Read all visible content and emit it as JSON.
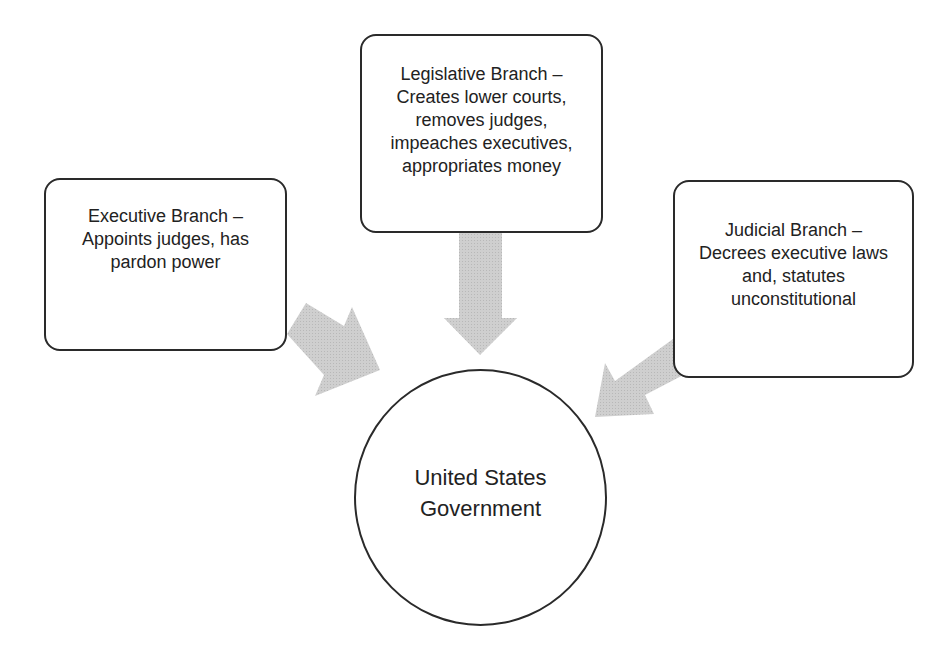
{
  "diagram": {
    "center": {
      "label": "United States Government"
    },
    "branches": [
      {
        "id": "executive",
        "label": "Executive Branch – Appoints judges, has pardon power"
      },
      {
        "id": "legislative",
        "label": "Legislative Branch – Creates lower courts, removes judges, impeaches executives, appropriates money"
      },
      {
        "id": "judicial",
        "label": "Judicial Branch – Decrees executive laws and, statutes unconstitutional"
      }
    ],
    "arrows": [
      {
        "from": "executive",
        "to": "center"
      },
      {
        "from": "legislative",
        "to": "center"
      },
      {
        "from": "judicial",
        "to": "center"
      }
    ],
    "colors": {
      "arrow_fill": "#c8c8c8",
      "border": "#2a2a2a",
      "text": "#222222",
      "background": "#ffffff"
    }
  }
}
